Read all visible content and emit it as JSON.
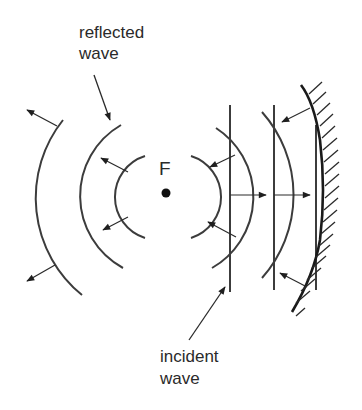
{
  "diagram": {
    "labels": {
      "reflected_line1": "reflected",
      "reflected_line2": "wave",
      "incident_line1": "incident",
      "incident_line2": "wave",
      "focus": "F"
    },
    "colors": {
      "line": "#3c3c3c",
      "mirror": "#1a1a1a",
      "background": "#ffffff"
    }
  }
}
